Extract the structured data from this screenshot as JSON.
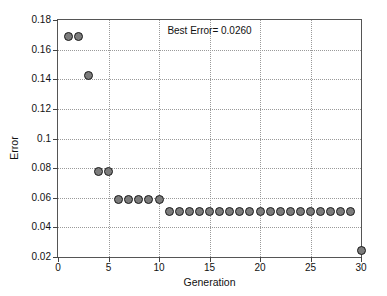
{
  "chart_data": {
    "type": "scatter",
    "title": "",
    "xlabel": "Generation",
    "ylabel": "Error",
    "xlim": [
      0,
      30
    ],
    "ylim": [
      0.02,
      0.18
    ],
    "xticks": [
      0,
      5,
      10,
      15,
      20,
      25,
      30
    ],
    "xtick_labels": [
      "0",
      "5",
      "10",
      "15",
      "20",
      "25",
      "30"
    ],
    "yticks": [
      0.02,
      0.04,
      0.06,
      0.08,
      0.1,
      0.12,
      0.14,
      0.16,
      0.18
    ],
    "ytick_labels": [
      "0.02",
      "0.04",
      "0.06",
      "0.08",
      "0.1",
      "0.12",
      "0.14",
      "0.16",
      "0.18"
    ],
    "grid": true,
    "legend": false,
    "marker": {
      "shape": "circle",
      "fill_color": "#7c7c7c",
      "edge_color": "#1a1a1a",
      "size_px": 9
    },
    "annotations": [
      {
        "text": "Best Error= 0.0260",
        "x": 15,
        "y": 0.1735
      }
    ],
    "x": [
      1,
      2,
      3,
      4,
      5,
      6,
      7,
      8,
      9,
      10,
      11,
      12,
      13,
      14,
      15,
      16,
      17,
      18,
      19,
      20,
      21,
      22,
      23,
      24,
      25,
      26,
      27,
      28,
      29,
      30
    ],
    "values": [
      0.169,
      0.169,
      0.1425,
      0.0775,
      0.0775,
      0.0585,
      0.0585,
      0.0585,
      0.0585,
      0.0585,
      0.051,
      0.051,
      0.051,
      0.051,
      0.051,
      0.051,
      0.051,
      0.051,
      0.051,
      0.051,
      0.051,
      0.051,
      0.051,
      0.051,
      0.051,
      0.051,
      0.051,
      0.051,
      0.051,
      0.0245
    ]
  }
}
